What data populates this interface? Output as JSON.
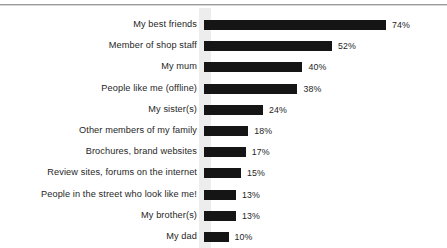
{
  "chart_data": {
    "type": "bar",
    "orientation": "horizontal",
    "title": "",
    "subtitle": "",
    "xlabel": "",
    "ylabel": "",
    "grid": false,
    "legend": null,
    "value_suffix": "%",
    "xlim": [
      0,
      74
    ],
    "axis_max_for_scale": 74,
    "categories": [
      "My best friends",
      "Member of shop staff",
      "My mum",
      "People like me (offline)",
      "My sister(s)",
      "Other members of my family",
      "Brochures, brand websites",
      "Review sites, forums on the internet",
      "People in the street who look like me!",
      "My brother(s)",
      "My dad"
    ],
    "values": [
      74,
      52,
      40,
      38,
      24,
      18,
      17,
      15,
      13,
      13,
      10
    ],
    "value_labels": [
      "74%",
      "52%",
      "40%",
      "38%",
      "24%",
      "18%",
      "17%",
      "15%",
      "13%",
      "13%",
      "10%"
    ],
    "colors": {
      "bar": "#151515",
      "text": "#262626",
      "background": "#ffffff",
      "axis_band": "#ededed",
      "top_rule": "#9a9a9a"
    }
  }
}
